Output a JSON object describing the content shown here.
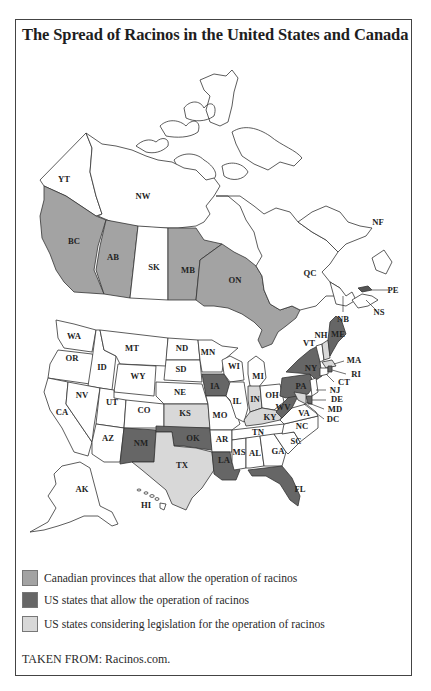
{
  "title": "The Spread of Racinos in the United States and Canada",
  "colors": {
    "canada_allow": "#a3a3a3",
    "us_allow": "#666666",
    "us_considering": "#d8d8d8",
    "none": "#ffffff",
    "outline": "#333333"
  },
  "map": {
    "canada": {
      "YT": {
        "label": "YT",
        "status": "none"
      },
      "NW": {
        "label": "NW",
        "status": "none"
      },
      "BC": {
        "label": "BC",
        "status": "canada_allow"
      },
      "AB": {
        "label": "AB",
        "status": "canada_allow"
      },
      "SK": {
        "label": "SK",
        "status": "none"
      },
      "MB": {
        "label": "MB",
        "status": "canada_allow"
      },
      "ON": {
        "label": "ON",
        "status": "canada_allow"
      },
      "QC": {
        "label": "QC",
        "status": "none"
      },
      "NF": {
        "label": "NF",
        "status": "none"
      },
      "NB": {
        "label": "NB",
        "status": "none"
      },
      "PE": {
        "label": "PE",
        "status": "none"
      },
      "NS": {
        "label": "NS",
        "status": "none"
      }
    },
    "us": {
      "WA": {
        "label": "WA",
        "status": "none"
      },
      "OR": {
        "label": "OR",
        "status": "none"
      },
      "CA": {
        "label": "CA",
        "status": "none"
      },
      "ID": {
        "label": "ID",
        "status": "none"
      },
      "NV": {
        "label": "NV",
        "status": "none"
      },
      "MT": {
        "label": "MT",
        "status": "none"
      },
      "WY": {
        "label": "WY",
        "status": "none"
      },
      "UT": {
        "label": "UT",
        "status": "none"
      },
      "AZ": {
        "label": "AZ",
        "status": "none"
      },
      "CO": {
        "label": "CO",
        "status": "none"
      },
      "NM": {
        "label": "NM",
        "status": "us_allow"
      },
      "ND": {
        "label": "ND",
        "status": "none"
      },
      "SD": {
        "label": "SD",
        "status": "none"
      },
      "NE": {
        "label": "NE",
        "status": "none"
      },
      "KS": {
        "label": "KS",
        "status": "us_considering"
      },
      "OK": {
        "label": "OK",
        "status": "us_allow"
      },
      "TX": {
        "label": "TX",
        "status": "us_considering"
      },
      "MN": {
        "label": "MN",
        "status": "none"
      },
      "IA": {
        "label": "IA",
        "status": "us_allow"
      },
      "MO": {
        "label": "MO",
        "status": "none"
      },
      "AR": {
        "label": "AR",
        "status": "none"
      },
      "LA": {
        "label": "LA",
        "status": "us_allow"
      },
      "WI": {
        "label": "WI",
        "status": "none"
      },
      "IL": {
        "label": "IL",
        "status": "none"
      },
      "MI": {
        "label": "MI",
        "status": "none"
      },
      "IN": {
        "label": "IN",
        "status": "us_considering"
      },
      "OH": {
        "label": "OH",
        "status": "none"
      },
      "KY": {
        "label": "KY",
        "status": "us_considering"
      },
      "TN": {
        "label": "TN",
        "status": "none"
      },
      "MS": {
        "label": "MS",
        "status": "none"
      },
      "AL": {
        "label": "AL",
        "status": "none"
      },
      "GA": {
        "label": "GA",
        "status": "none"
      },
      "FL": {
        "label": "FL",
        "status": "us_allow"
      },
      "SC": {
        "label": "SC",
        "status": "none"
      },
      "NC": {
        "label": "NC",
        "status": "none"
      },
      "VA": {
        "label": "VA",
        "status": "none"
      },
      "WV": {
        "label": "WV",
        "status": "us_allow"
      },
      "PA": {
        "label": "PA",
        "status": "us_allow"
      },
      "NY": {
        "label": "NY",
        "status": "us_allow"
      },
      "VT": {
        "label": "VT",
        "status": "none"
      },
      "NH": {
        "label": "NH",
        "status": "none"
      },
      "ME": {
        "label": "ME",
        "status": "us_allow"
      },
      "MA": {
        "label": "MA",
        "status": "us_considering"
      },
      "RI": {
        "label": "RI",
        "status": "us_allow"
      },
      "CT": {
        "label": "CT",
        "status": "none"
      },
      "NJ": {
        "label": "NJ",
        "status": "none"
      },
      "DE": {
        "label": "DE",
        "status": "us_allow"
      },
      "MD": {
        "label": "MD",
        "status": "us_considering"
      },
      "DC": {
        "label": "DC",
        "status": "none"
      },
      "AK": {
        "label": "AK",
        "status": "none"
      },
      "HI": {
        "label": "HI",
        "status": "none"
      }
    }
  },
  "legend": [
    {
      "status": "canada_allow",
      "label": "Canadian provinces that allow the operation of racinos"
    },
    {
      "status": "us_allow",
      "label": "US states that allow the operation of racinos"
    },
    {
      "status": "us_considering",
      "label": "US states considering legislation for the operation of racinos"
    }
  ],
  "source": "TAKEN FROM: Racinos.com."
}
